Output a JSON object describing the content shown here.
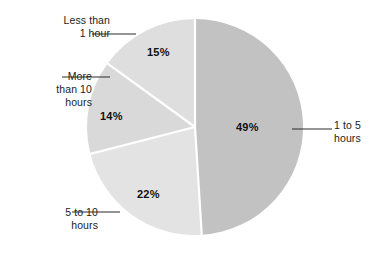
{
  "chart_data": {
    "type": "pie",
    "title": "",
    "subtitle": "",
    "xlabel": "",
    "ylabel": "",
    "legend_position": "callout-labels",
    "grid": false,
    "unit": "%",
    "start_angle_deg": 0,
    "direction": "clockwise",
    "categories": [
      "1 to 5 hours",
      "5 to 10 hours",
      "More than 10 hours",
      "Less than 1 hour"
    ],
    "values": [
      49,
      22,
      14,
      15
    ],
    "value_labels": [
      "49%",
      "22%",
      "14%",
      "15%"
    ],
    "colors": [
      "#c2c2c2",
      "#e3e3e3",
      "#d9d9d9",
      "#dedede"
    ],
    "slices": [
      {
        "label": "1 to 5 hours",
        "label_lines": "1 to 5\nhours",
        "value": 49,
        "value_label": "49%",
        "color": "#c2c2c2",
        "start_angle_deg": 0,
        "end_angle_deg": 176.4
      },
      {
        "label": "5 to 10 hours",
        "label_lines": "5 to 10\nhours",
        "value": 22,
        "value_label": "22%",
        "color": "#e3e3e3",
        "start_angle_deg": 176.4,
        "end_angle_deg": 255.6
      },
      {
        "label": "More than 10 hours",
        "label_lines": "More\nthan 10\nhours",
        "value": 14,
        "value_label": "14%",
        "color": "#d9d9d9",
        "start_angle_deg": 255.6,
        "end_angle_deg": 306.0
      },
      {
        "label": "Less than 1 hour",
        "label_lines": "Less than\n1 hour",
        "value": 15,
        "value_label": "15%",
        "color": "#dedede",
        "start_angle_deg": 306.0,
        "end_angle_deg": 360.0
      }
    ]
  },
  "geometry": {
    "center_x": 195,
    "center_y": 127,
    "radius": 108,
    "separator_color": "#ffffff",
    "separator_width": 2.2,
    "leader_color": "#2b2b2b"
  },
  "labels": {
    "less_than_1_hour": "Less than\n1 hour",
    "more_than_10_hours": "More\nthan 10\nhours",
    "five_to_ten_hours": "5 to 10\nhours",
    "one_to_five_hours": "1 to 5\nhours"
  },
  "values": {
    "less_than_1_hour": "15%",
    "more_than_10_hours": "14%",
    "five_to_ten_hours": "22%",
    "one_to_five_hours": "49%"
  }
}
